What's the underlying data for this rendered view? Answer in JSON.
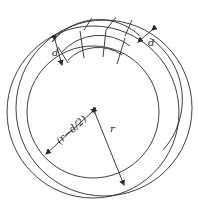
{
  "diagram": {
    "type": "cross-section of ring / torus with winding segments",
    "labels": {
      "d_left": "d",
      "d_right": "d",
      "inner_radius": "(r−d/2)",
      "outer_radius": "r"
    },
    "colors": {
      "stroke": "#2a2a2a",
      "background": "#ffffff"
    }
  }
}
